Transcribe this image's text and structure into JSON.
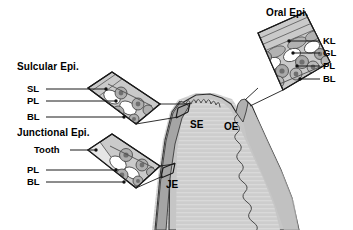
{
  "figure": {
    "type": "dental-histology-diagram",
    "background_color": "#ffffff",
    "palette": {
      "outline": "#1a1a1a",
      "gingiva_fill": "#c9c9c9",
      "gingiva_core_fill": "#d6d6d6",
      "connective_fill": "#bdbdbd",
      "epithelial_band": "#a8a8a8",
      "tooth_fill": "#e2e2e2",
      "cell_fill": "#b4b4b4",
      "nucleus": "#6e6e6e",
      "marker_dot": "#111111"
    }
  },
  "panels": [
    {
      "id": "oral-epi",
      "title": "Oral Epi.",
      "labels": [
        {
          "id": "kl",
          "text": "KL"
        },
        {
          "id": "gl",
          "text": "GL"
        },
        {
          "id": "pl",
          "text": "PL"
        },
        {
          "id": "bl",
          "text": "BL"
        }
      ]
    },
    {
      "id": "sulcular-epi",
      "title": "Sulcular Epi.",
      "labels": [
        {
          "id": "sl",
          "text": "SL"
        },
        {
          "id": "pl",
          "text": "PL"
        },
        {
          "id": "bl",
          "text": "BL"
        }
      ]
    },
    {
      "id": "junctional-epi",
      "title": "Junctional Epi.",
      "labels": [
        {
          "id": "tooth",
          "text": "Tooth"
        },
        {
          "id": "pl",
          "text": "PL"
        },
        {
          "id": "bl",
          "text": "BL"
        }
      ]
    }
  ],
  "anatomy_markers": [
    {
      "id": "se",
      "text": "SE"
    },
    {
      "id": "oe",
      "text": "OE"
    },
    {
      "id": "je",
      "text": "JE"
    }
  ]
}
